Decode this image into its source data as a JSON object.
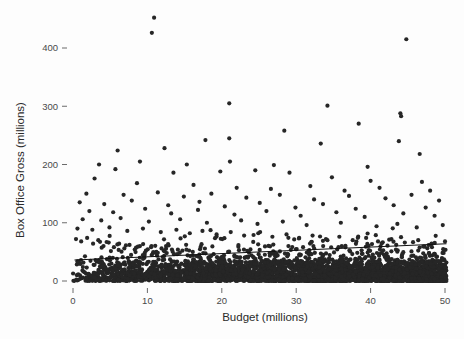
{
  "chart_data": {
    "type": "scatter",
    "title": "",
    "xlabel": "Budget (millions)",
    "ylabel": "Box Office Gross (millions)",
    "xlim": [
      -1.5,
      52
    ],
    "ylim": [
      -22,
      455
    ],
    "xticks": [
      0,
      10,
      20,
      30,
      40,
      50
    ],
    "xtick_labels": [
      "0",
      "10",
      "20",
      "30",
      "40",
      "50"
    ],
    "yticks": [
      0,
      100,
      200,
      300,
      400
    ],
    "ytick_labels": [
      "0",
      "100",
      "200",
      "300",
      "400"
    ],
    "grid": false,
    "legend": null,
    "marker": {
      "shape": "circle",
      "color": "#262626",
      "size_px": 4.2
    },
    "trend_line": {
      "present": true,
      "color": "#111111",
      "x_start": 0.2,
      "y_start": 36,
      "x_end": 50.2,
      "y_end": 64
    },
    "points": [
      [
        10.9,
        452
      ],
      [
        10.6,
        426
      ],
      [
        44.8,
        415
      ],
      [
        21.0,
        305
      ],
      [
        34.2,
        301
      ],
      [
        44.0,
        288
      ],
      [
        44.1,
        283
      ],
      [
        38.4,
        270
      ],
      [
        28.4,
        258
      ],
      [
        21.0,
        245
      ],
      [
        17.8,
        242
      ],
      [
        43.8,
        240
      ],
      [
        33.3,
        236
      ],
      [
        46.6,
        218
      ],
      [
        21.1,
        205
      ],
      [
        15.3,
        200
      ],
      [
        27.0,
        199
      ],
      [
        39.6,
        196
      ],
      [
        6.0,
        224
      ],
      [
        12.3,
        228
      ],
      [
        9.0,
        205
      ],
      [
        3.5,
        200
      ],
      [
        5.7,
        192
      ],
      [
        13.5,
        186
      ],
      [
        19.8,
        188
      ],
      [
        24.5,
        190
      ],
      [
        29.1,
        186
      ],
      [
        34.8,
        178
      ],
      [
        40.0,
        172
      ],
      [
        46.9,
        170
      ],
      [
        2.9,
        176
      ],
      [
        8.6,
        168
      ],
      [
        16.2,
        165
      ],
      [
        22.0,
        160
      ],
      [
        26.6,
        158
      ],
      [
        31.9,
        163
      ],
      [
        36.5,
        155
      ],
      [
        41.2,
        160
      ],
      [
        48.0,
        155
      ],
      [
        1.8,
        150
      ],
      [
        6.8,
        148
      ],
      [
        11.4,
        152
      ],
      [
        14.9,
        145
      ],
      [
        18.6,
        150
      ],
      [
        23.3,
        143
      ],
      [
        27.8,
        148
      ],
      [
        32.4,
        140
      ],
      [
        37.1,
        146
      ],
      [
        42.0,
        142
      ],
      [
        45.5,
        148
      ],
      [
        49.2,
        138
      ],
      [
        0.9,
        135
      ],
      [
        4.2,
        132
      ],
      [
        7.9,
        138
      ],
      [
        12.8,
        130
      ],
      [
        17.0,
        136
      ],
      [
        20.4,
        128
      ],
      [
        25.1,
        134
      ],
      [
        29.9,
        126
      ],
      [
        33.6,
        132
      ],
      [
        38.0,
        124
      ],
      [
        43.1,
        130
      ],
      [
        47.4,
        126
      ],
      [
        2.2,
        120
      ],
      [
        5.4,
        118
      ],
      [
        9.7,
        124
      ],
      [
        13.2,
        116
      ],
      [
        16.8,
        122
      ],
      [
        21.7,
        114
      ],
      [
        26.0,
        120
      ],
      [
        30.6,
        112
      ],
      [
        35.4,
        118
      ],
      [
        39.2,
        110
      ],
      [
        44.4,
        116
      ],
      [
        48.6,
        112
      ],
      [
        1.3,
        106
      ],
      [
        3.8,
        104
      ],
      [
        6.4,
        108
      ],
      [
        10.2,
        102
      ],
      [
        14.4,
        106
      ],
      [
        18.0,
        100
      ],
      [
        22.6,
        104
      ],
      [
        24.8,
        98
      ],
      [
        28.2,
        102
      ],
      [
        31.4,
        96
      ],
      [
        36.0,
        100
      ],
      [
        40.8,
        94
      ],
      [
        43.6,
        98
      ],
      [
        46.2,
        92
      ],
      [
        49.7,
        96
      ],
      [
        0.6,
        90
      ],
      [
        2.6,
        88
      ],
      [
        4.9,
        92
      ],
      [
        7.3,
        86
      ],
      [
        9.4,
        90
      ],
      [
        11.8,
        84
      ],
      [
        13.9,
        88
      ],
      [
        15.7,
        82
      ],
      [
        17.4,
        86
      ],
      [
        19.3,
        80
      ],
      [
        21.2,
        84
      ],
      [
        23.0,
        78
      ],
      [
        24.9,
        82
      ],
      [
        26.8,
        76
      ],
      [
        28.7,
        80
      ],
      [
        30.4,
        74
      ],
      [
        32.2,
        78
      ],
      [
        34.0,
        72
      ],
      [
        35.8,
        76
      ],
      [
        37.6,
        70
      ],
      [
        39.4,
        74
      ],
      [
        41.0,
        68
      ],
      [
        42.8,
        72
      ],
      [
        44.6,
        66
      ],
      [
        46.4,
        70
      ],
      [
        48.2,
        64
      ],
      [
        50.0,
        68
      ],
      [
        0.4,
        72
      ],
      [
        1.1,
        68
      ],
      [
        1.9,
        74
      ],
      [
        2.7,
        64
      ],
      [
        3.4,
        70
      ],
      [
        4.1,
        60
      ],
      [
        4.8,
        66
      ],
      [
        5.5,
        58
      ],
      [
        6.2,
        64
      ],
      [
        6.9,
        56
      ],
      [
        7.6,
        62
      ],
      [
        8.3,
        54
      ],
      [
        9.0,
        60
      ],
      [
        9.8,
        52
      ],
      [
        10.5,
        58
      ],
      [
        11.2,
        50
      ],
      [
        11.9,
        56
      ],
      [
        12.6,
        48
      ],
      [
        13.3,
        54
      ],
      [
        14.0,
        46
      ],
      [
        14.7,
        52
      ],
      [
        15.4,
        44
      ],
      [
        16.1,
        50
      ],
      [
        16.8,
        42
      ],
      [
        17.5,
        48
      ],
      [
        18.2,
        40
      ],
      [
        18.9,
        46
      ],
      [
        19.6,
        38
      ],
      [
        20.3,
        44
      ],
      [
        21.0,
        36
      ],
      [
        21.7,
        42
      ],
      [
        22.4,
        34
      ],
      [
        23.1,
        40
      ],
      [
        23.8,
        32
      ],
      [
        24.5,
        38
      ],
      [
        25.2,
        30
      ],
      [
        25.9,
        36
      ],
      [
        26.6,
        28
      ],
      [
        27.3,
        34
      ],
      [
        28.0,
        26
      ],
      [
        28.7,
        32
      ],
      [
        29.4,
        24
      ],
      [
        30.1,
        30
      ],
      [
        30.8,
        22
      ],
      [
        31.5,
        28
      ],
      [
        32.2,
        20
      ],
      [
        32.9,
        26
      ],
      [
        33.6,
        18
      ],
      [
        34.3,
        24
      ],
      [
        35.0,
        16
      ],
      [
        35.7,
        22
      ],
      [
        36.4,
        14
      ],
      [
        37.1,
        20
      ],
      [
        37.8,
        12
      ],
      [
        38.5,
        18
      ],
      [
        39.2,
        10
      ],
      [
        39.9,
        16
      ],
      [
        40.6,
        8
      ],
      [
        41.3,
        14
      ],
      [
        42.0,
        6
      ],
      [
        42.7,
        12
      ],
      [
        43.4,
        5
      ],
      [
        44.1,
        11
      ],
      [
        44.8,
        4
      ],
      [
        45.5,
        10
      ],
      [
        46.2,
        3
      ],
      [
        46.9,
        9
      ],
      [
        47.6,
        2
      ],
      [
        48.3,
        8
      ],
      [
        49.0,
        2
      ],
      [
        49.7,
        7
      ]
    ]
  }
}
